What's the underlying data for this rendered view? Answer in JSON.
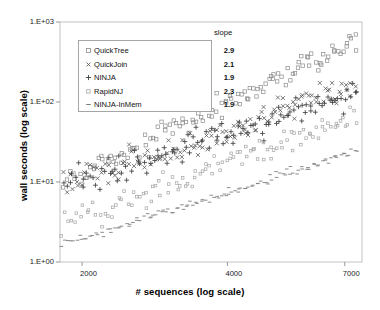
{
  "chart_data": {
    "type": "scatter",
    "title": "",
    "xlabel": "# sequences (log scale)",
    "ylabel": "wall seconds (log scale)",
    "xscale": "log",
    "yscale": "log",
    "xlim": [
      1800,
      7600
    ],
    "ylim": [
      1,
      1000
    ],
    "xticks": [
      2000,
      4000,
      7000
    ],
    "xtick_labels": [
      "2000",
      "4000",
      "7000"
    ],
    "yticks": [
      1,
      10,
      100,
      1000
    ],
    "ytick_labels": [
      "1.E+00",
      "1.E+01",
      "1.E+02",
      "1.E+03"
    ],
    "grid": false,
    "legend_position": "upper-left",
    "legend_header": "slope",
    "series": [
      {
        "name": "QuickTree",
        "marker": "open-square",
        "color": "#8c8c8c",
        "slope": 2.9,
        "intercept_y_at_2000": 13.0,
        "scatter_spread": 0.13,
        "n_points": 120
      },
      {
        "name": "QuickJoin",
        "marker": "x",
        "color": "#595959",
        "slope": 2.1,
        "intercept_y_at_2000": 10.5,
        "scatter_spread": 0.16,
        "n_points": 120
      },
      {
        "name": "NINJA",
        "marker": "plus",
        "color": "#404040",
        "slope": 1.9,
        "intercept_y_at_2000": 11.0,
        "scatter_spread": 0.17,
        "n_points": 120
      },
      {
        "name": "RapidNJ",
        "marker": "open-square-small",
        "color": "#a6a6a6",
        "slope": 2.3,
        "intercept_y_at_2000": 3.6,
        "scatter_spread": 0.17,
        "n_points": 110
      },
      {
        "name": "NINJA-InMem",
        "marker": "dash",
        "color": "#7f7f7f",
        "slope": 1.9,
        "intercept_y_at_2000": 2.0,
        "scatter_spread": 0.055,
        "n_points": 120
      }
    ]
  },
  "legend": {
    "header": "slope",
    "rows": [
      {
        "label": "QuickTree",
        "slope": "2.9"
      },
      {
        "label": "QuickJoin",
        "slope": "2.1"
      },
      {
        "label": "NINJA",
        "slope": "1.9"
      },
      {
        "label": "RapidNJ",
        "slope": "2.3"
      },
      {
        "label": "NINJA-InMem",
        "slope": "1.9"
      }
    ]
  },
  "axes": {
    "x_title": "# sequences (log scale)",
    "y_title": "wall seconds (log scale)",
    "x_tick_labels": [
      "2000",
      "4000",
      "7000"
    ],
    "y_tick_labels": [
      "1.E+03",
      "1.E+02",
      "1.E+01",
      "1.E+00"
    ]
  }
}
